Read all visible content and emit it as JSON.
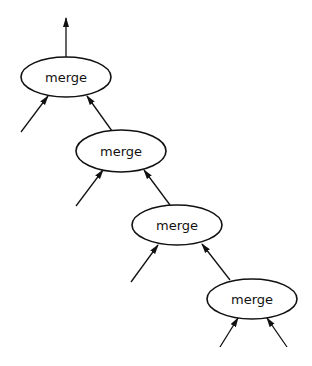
{
  "diagram": {
    "type": "merge-tree",
    "colors": {
      "stroke": "#111111",
      "background": "#ffffff"
    },
    "output_arrow": {
      "from": [
        66,
        57
      ],
      "to": [
        66,
        18
      ]
    },
    "nodes": [
      {
        "id": "merge1",
        "label": "merge",
        "cx": 66,
        "cy": 77,
        "rx": 45,
        "ry": 20
      },
      {
        "id": "merge2",
        "label": "merge",
        "cx": 121,
        "cy": 151,
        "rx": 45,
        "ry": 21
      },
      {
        "id": "merge3",
        "label": "merge",
        "cx": 177,
        "cy": 225,
        "rx": 45,
        "ry": 20
      },
      {
        "id": "merge4",
        "label": "merge",
        "cx": 252,
        "cy": 299,
        "rx": 45,
        "ry": 20
      }
    ],
    "edges": [
      {
        "from": [
          21,
          132
        ],
        "to": [
          48,
          96
        ],
        "target": "merge1"
      },
      {
        "from": [
          112,
          131
        ],
        "to": [
          87,
          96
        ],
        "target": "merge1"
      },
      {
        "from": [
          76,
          206
        ],
        "to": [
          103,
          170
        ],
        "target": "merge2"
      },
      {
        "from": [
          170,
          205
        ],
        "to": [
          144,
          170
        ],
        "target": "merge2"
      },
      {
        "from": [
          131,
          282
        ],
        "to": [
          158,
          245
        ],
        "target": "merge3"
      },
      {
        "from": [
          230,
          280
        ],
        "to": [
          202,
          244
        ],
        "target": "merge3"
      },
      {
        "from": [
          220,
          347
        ],
        "to": [
          238,
          318
        ],
        "target": "merge4"
      },
      {
        "from": [
          287,
          347
        ],
        "to": [
          267,
          318
        ],
        "target": "merge4"
      }
    ]
  }
}
